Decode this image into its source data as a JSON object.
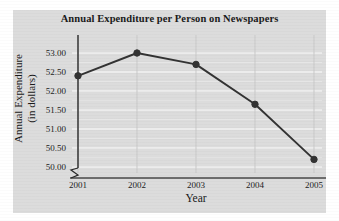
{
  "chart_data": {
    "type": "line",
    "title": "Annual Expenditure per Person on Newspapers",
    "xlabel": "Year",
    "ylabel_line1": "Annual Expenditure",
    "ylabel_line2": "(in dollars)",
    "categories": [
      "2001",
      "2002",
      "2003",
      "2004",
      "2005"
    ],
    "values": [
      52.4,
      53.0,
      52.7,
      51.65,
      50.2
    ],
    "x": [
      2001,
      2002,
      2003,
      2004,
      2005
    ],
    "yticks": [
      "50.00",
      "50.50",
      "51.00",
      "51.50",
      "52.00",
      "52.50",
      "53.00"
    ],
    "ytick_values": [
      50.0,
      50.5,
      51.0,
      51.5,
      52.0,
      52.5,
      53.0
    ],
    "ylim": [
      50.0,
      53.2
    ],
    "xlim": [
      2000.75,
      2005.25
    ],
    "grid": true,
    "grid_color": "#f2f2f2",
    "legend": false,
    "axis_break": true,
    "series_color": "#333333",
    "marker": "circle",
    "panel_color": "#dcdcdc",
    "background_color": "#ffffff"
  }
}
